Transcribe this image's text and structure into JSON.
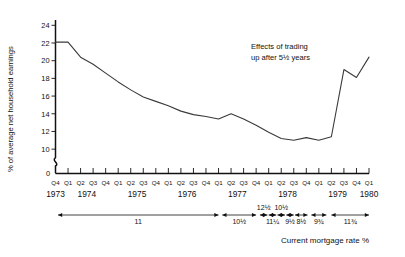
{
  "chart_data": {
    "type": "line",
    "title": "",
    "ylabel": "% of average net household earnings",
    "xlabel": "",
    "ylim": [
      9,
      24.6
    ],
    "yticks": [
      24,
      22,
      20,
      18,
      16,
      14,
      12,
      10
    ],
    "ytick_labels": [
      "24",
      "22",
      "20",
      "18",
      "16",
      "14",
      "12",
      "10"
    ],
    "axis_break": true,
    "zero_label": "0",
    "grid": false,
    "legend": "none",
    "x": [
      "1973 Q4",
      "1974 Q1",
      "1974 Q2",
      "1974 Q3",
      "1974 Q4",
      "1975 Q1",
      "1975 Q2",
      "1975 Q3",
      "1975 Q4",
      "1976 Q1",
      "1976 Q2",
      "1976 Q3",
      "1976 Q4",
      "1977 Q1",
      "1977 Q2",
      "1977 Q3",
      "1977 Q4",
      "1978 Q1",
      "1978 Q2",
      "1978 Q3",
      "1978 Q4",
      "1979 Q1",
      "1979 Q2",
      "1979 Q3",
      "1979 Q4",
      "1980 Q1"
    ],
    "values": [
      22.1,
      22.1,
      20.4,
      19.6,
      18.6,
      17.6,
      16.7,
      15.9,
      15.4,
      14.9,
      14.3,
      13.9,
      13.7,
      13.4,
      14.0,
      13.4,
      12.7,
      11.9,
      11.2,
      11.0,
      11.3,
      11.0,
      11.4,
      19.0,
      18.1,
      20.4
    ],
    "quarter_labels": [
      "Q4",
      "Q1",
      "Q2",
      "Q3",
      "Q4",
      "Q1",
      "Q2",
      "Q3",
      "Q4",
      "Q1",
      "Q2",
      "Q3",
      "Q4",
      "Q1",
      "Q2",
      "Q3",
      "Q4",
      "Q1",
      "Q2",
      "Q3",
      "Q4",
      "Q1",
      "Q2",
      "Q3",
      "Q4",
      "Q1"
    ],
    "year_labels": [
      "1973",
      "1974",
      "1975",
      "1976",
      "1977",
      "1978",
      "1979",
      "1980"
    ],
    "annotations": [
      {
        "name": "trading-up-note",
        "line1": "Effects of trading",
        "line2": "up after 5½ years"
      }
    ]
  },
  "mortgage_rate_axis": {
    "caption": "Current mortgage rate %",
    "segments": [
      {
        "label": "11",
        "label_pos": "below"
      },
      {
        "label": "10½",
        "label_pos": "below"
      },
      {
        "label": "12½",
        "label_pos": "above"
      },
      {
        "label": "11¼",
        "label_pos": "below"
      },
      {
        "label": "10½",
        "label_pos": "above"
      },
      {
        "label": "9½",
        "label_pos": "below"
      },
      {
        "label": "8½",
        "label_pos": "below"
      },
      {
        "label": "9¾",
        "label_pos": "below"
      },
      {
        "label": "11¾",
        "label_pos": "below"
      }
    ]
  }
}
